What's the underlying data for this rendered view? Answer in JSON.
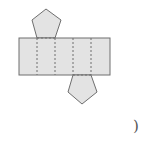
{
  "figure": {
    "fill_color": "#e3e3e3",
    "stroke_color": "#6e6e6e",
    "fold_line_style": "dashed",
    "lateral_faces": 5,
    "base_faces": 2
  },
  "answer_blank": {
    "closing_paren": ")"
  }
}
